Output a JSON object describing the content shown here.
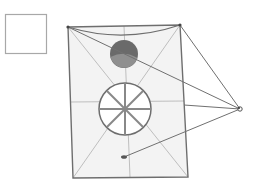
{
  "diagram": {
    "type": "geometric-line-drawing",
    "colors": {
      "background": "#ffffff",
      "frame_fill": "#f2f2f2",
      "line": "#6e6e6e",
      "thin_line": "#b5b5b5",
      "dark_circle": "#6a6a6a",
      "dark_circle_light_half": "#8c8c8c",
      "square_stroke": "#a8a8a8"
    },
    "small_square": {
      "x": 5,
      "y": 14,
      "w": 42,
      "h": 40
    },
    "frame": {
      "tl": [
        68,
        27
      ],
      "tr": [
        180,
        25
      ],
      "br": [
        188,
        177
      ],
      "bl": [
        73,
        178
      ],
      "top_curve_control": [
        124,
        40
      ]
    },
    "dark_circle": {
      "cx": 124,
      "cy": 54,
      "r": 14
    },
    "wheel": {
      "cx": 125,
      "cy": 109,
      "r": 26,
      "spokes": 8
    },
    "vanishing_point": {
      "cx": 240,
      "cy": 109
    },
    "bottom_marker": {
      "cx": 124,
      "cy": 157
    }
  }
}
